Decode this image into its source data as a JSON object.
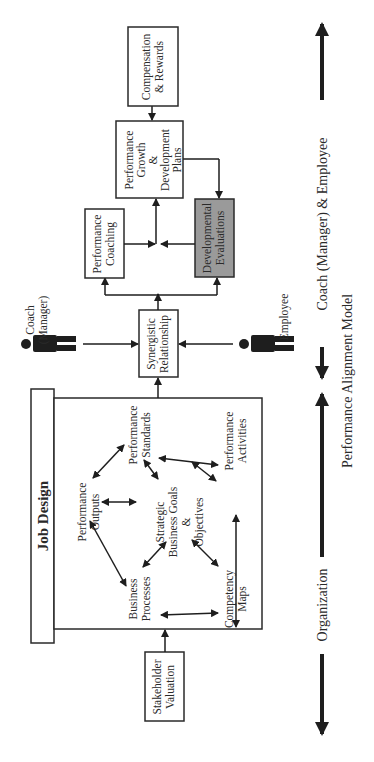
{
  "diagram": {
    "caption": "Performance Alignment Model",
    "job_design": {
      "title": "Job Design",
      "center": [
        "Strategic",
        "Business Goals",
        "&",
        "Objectives"
      ],
      "nodes": {
        "performance_outputs": [
          "Performance",
          "Outputs"
        ],
        "performance_standards": [
          "Performance",
          "Standards"
        ],
        "performance_activities": [
          "Performance",
          "Activities"
        ],
        "competency_maps": [
          "Competency",
          "Maps"
        ],
        "business_processes": [
          "Business",
          "Processes"
        ]
      }
    },
    "stakeholder_valuation": [
      "Stakeholder",
      "Valuation"
    ],
    "synergistic_relationship": [
      "Synergistic",
      "Relationship"
    ],
    "coach": [
      "Coach",
      "(Manager)"
    ],
    "employee": [
      "Employee"
    ],
    "performance_coaching": [
      "Performance",
      "Coaching"
    ],
    "developmental_evaluations": [
      "Developmental",
      "Evaluations"
    ],
    "performance_growth": [
      "Performance",
      "Growth",
      "&",
      "Development",
      "Plans"
    ],
    "compensation": [
      "Compensation",
      "& Rewards"
    ],
    "axis": {
      "left_label": "Organization",
      "right_label": "Coach (Manager) & Employee"
    },
    "colors": {
      "line": "#1e1e1e",
      "shaded_box": "#9a9a9a",
      "box_border": "#2a2a2a"
    }
  }
}
